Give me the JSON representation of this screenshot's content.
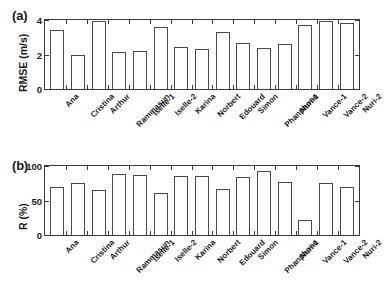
{
  "figure": {
    "panel_a_tag": "(a)",
    "panel_b_tag": "(b)",
    "axis_color": "#3b3b3b",
    "bar_edge_color": "#4a4a4a",
    "bar_fill_color": "#ffffff",
    "background": "#ffffff"
  },
  "categories": [
    "Ana",
    "Cristina",
    "Arthur",
    "Rammasun",
    "Iselle-1",
    "Iselle-2",
    "Karina",
    "Norbert",
    "Edouard",
    "Simon",
    "Phanphone",
    "Nuri-1",
    "Vance-1",
    "Vance-2",
    "Nuri-2"
  ],
  "chart_data": [
    {
      "type": "bar",
      "panel": "(a)",
      "title": "",
      "xlabel": "",
      "ylabel": "RMSE (m/s)",
      "categories": [
        "Ana",
        "Cristina",
        "Arthur",
        "Rammasun",
        "Iselle-1",
        "Iselle-2",
        "Karina",
        "Norbert",
        "Edouard",
        "Simon",
        "Phanphone",
        "Nuri-1",
        "Vance-1",
        "Vance-2",
        "Nuri-2"
      ],
      "values": [
        3.4,
        2.0,
        3.95,
        2.15,
        2.2,
        3.6,
        2.45,
        2.3,
        3.3,
        2.65,
        2.35,
        2.6,
        3.7,
        3.95,
        3.8
      ],
      "ylim": [
        0,
        4
      ],
      "yticks": [
        0,
        2,
        4
      ],
      "ytick_labels": [
        "0",
        "2",
        "4"
      ],
      "grid": false,
      "legend": false,
      "bar_style": "white fill, dark outline",
      "tick_direction": "in"
    },
    {
      "type": "bar",
      "panel": "(b)",
      "title": "",
      "xlabel": "",
      "ylabel": "R (%)",
      "categories": [
        "Ana",
        "Cristina",
        "Arthur",
        "Rammasun",
        "Iselle-1",
        "Iselle-2",
        "Karina",
        "Norbert",
        "Edouard",
        "Simon",
        "Phanphone",
        "Nuri-1",
        "Vance-1",
        "Vance-2",
        "Nuri-2"
      ],
      "values": [
        69,
        75,
        65,
        88,
        87,
        61,
        85,
        86,
        67,
        84,
        93,
        77,
        22,
        75,
        69
      ],
      "ylim": [
        0,
        100
      ],
      "yticks": [
        0,
        50,
        100
      ],
      "ytick_labels": [
        "0",
        "50",
        "100"
      ],
      "grid": false,
      "legend": false,
      "bar_style": "white fill, dark outline",
      "tick_direction": "in"
    }
  ]
}
